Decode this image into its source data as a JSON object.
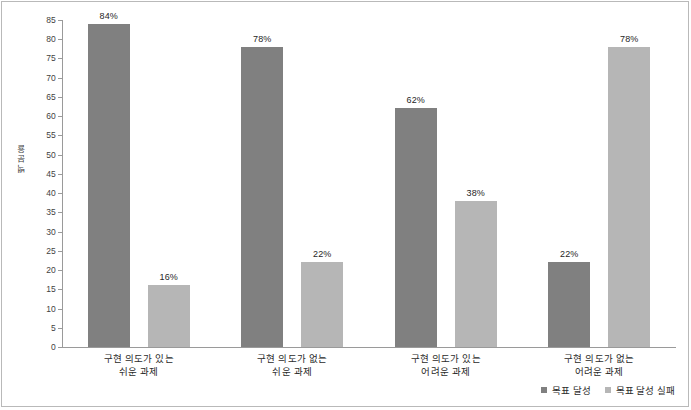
{
  "chart_data": {
    "type": "bar",
    "title": "",
    "subtitle": "",
    "xlabel": "",
    "ylabel": "백분율",
    "ylim": [
      0,
      85
    ],
    "ytick_step": 5,
    "yticks": [
      "0",
      "5",
      "10",
      "15",
      "20",
      "25",
      "30",
      "35",
      "40",
      "45",
      "50",
      "55",
      "60",
      "65",
      "70",
      "75",
      "80",
      "85"
    ],
    "grid": false,
    "legend_position": "bottom-right",
    "categories": [
      {
        "line1": "구현 의도가 있는",
        "line2": "쉬운 과제"
      },
      {
        "line1": "구현 의도가 없는",
        "line2": "쉬운 과제"
      },
      {
        "line1": "구현 의도가 있는",
        "line2": "어려운 과제"
      },
      {
        "line1": "구현 의도가 없는",
        "line2": "어려운 과제"
      }
    ],
    "series": [
      {
        "name": "목표 달성",
        "color": "#808080",
        "values": [
          84,
          78,
          62,
          22
        ],
        "labels": [
          "84%",
          "78%",
          "62%",
          "22%"
        ]
      },
      {
        "name": "목표 달성 실패",
        "color": "#b6b6b6",
        "values": [
          16,
          22,
          38,
          78
        ],
        "labels": [
          "16%",
          "22%",
          "38%",
          "78%"
        ]
      }
    ]
  }
}
